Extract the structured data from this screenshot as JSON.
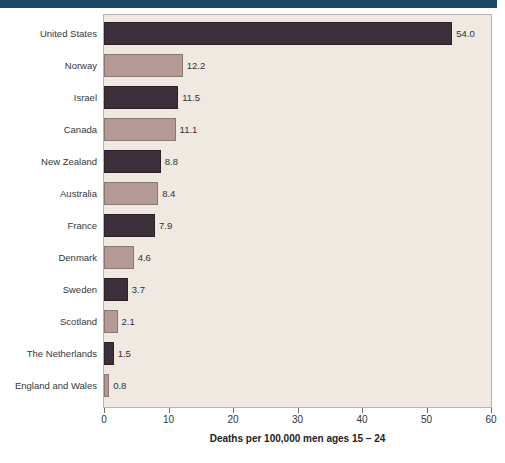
{
  "chart_data": {
    "type": "bar",
    "orientation": "horizontal",
    "title": "",
    "xlabel": "Deaths per 100,000 men ages 15 – 24",
    "ylabel": "",
    "xlim": [
      0,
      60
    ],
    "xticks": [
      0,
      10,
      20,
      30,
      40,
      50,
      60
    ],
    "xtick_labels": [
      "0",
      "10",
      "20",
      "30",
      "40",
      "50",
      "60"
    ],
    "grid": false,
    "legend": null,
    "categories": [
      "United States",
      "Norway",
      "Israel",
      "Canada",
      "New Zealand",
      "Australia",
      "France",
      "Denmark",
      "Sweden",
      "Scotland",
      "The Netherlands",
      "England and Wales"
    ],
    "values": [
      54.0,
      12.2,
      11.5,
      11.1,
      8.8,
      8.4,
      7.9,
      4.6,
      3.7,
      2.1,
      1.5,
      0.8
    ],
    "value_labels": [
      "54.0",
      "12.2",
      "11.5",
      "11.1",
      "8.8",
      "8.4",
      "7.9",
      "4.6",
      "3.7",
      "2.1",
      "1.5",
      "0.8"
    ],
    "bar_styles": [
      "dark",
      "light",
      "dark",
      "light",
      "dark",
      "light",
      "dark",
      "light",
      "dark",
      "light",
      "dark",
      "light"
    ]
  },
  "colors": {
    "bar_dark": "#3d3038",
    "bar_light": "#b49a94",
    "plot_background": "#efe9e2",
    "page_background": "#ffffff",
    "top_band": "#1c4a66",
    "text": "#2e3338",
    "plot_border": "#b9b4ae"
  }
}
